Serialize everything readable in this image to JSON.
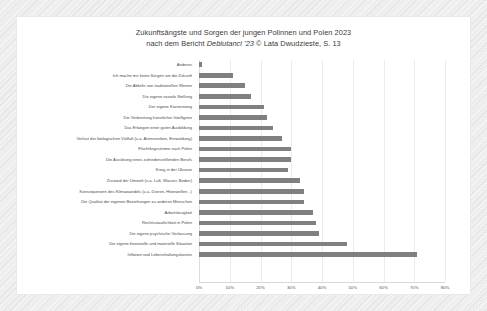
{
  "frame": {
    "border_color": "#ececed",
    "card_bg": "#ffffff"
  },
  "chart_data": {
    "type": "bar",
    "orientation": "horizontal",
    "title": "Zukunftsängste und Sorgen der jungen Polinnen und Polen 2023",
    "subtitle_prefix": "nach dem Bericht ",
    "subtitle_italic": "Debiutanci '23",
    "subtitle_suffix": " © Lata Dwudzieste, S. 13",
    "xlabel": "",
    "ylabel": "",
    "xlim": [
      0,
      80
    ],
    "grid": true,
    "legend": "none",
    "bar_color": "#808080",
    "xtick_labels": [
      "0%",
      "10%",
      "20%",
      "30%",
      "40%",
      "50%",
      "60%",
      "70%",
      "80%"
    ],
    "xtick_values": [
      0,
      10,
      20,
      30,
      40,
      50,
      60,
      70,
      80
    ],
    "categories": [
      "Anderes",
      "Ich mache mir keine Sorgen um die Zukunft",
      "Die Abkehr von traditionellen Werten",
      "Die eigene soziale Stellung",
      "Der eigene Karriereweg",
      "Die Verbreitung künstlicher Intelligenz",
      "Das Erlangen einer guten Ausbildung",
      "Verlust der biologischen Vielfalt (u.a. Artensterben, Entwaldung)",
      "Flüchtlingsströme nach Polen",
      "Die Ausübung eines zufriedenstellenden Berufs",
      "Krieg in der Ukraine",
      "Zustand der Umwelt (u.a. Luft, Wasser, Boden)",
      "Konsequenzen des Klimawandels (u.a. Dürren, Hitzewellen...)",
      "Die Qualität der eigenen Beziehungen zu anderen Menschen",
      "Arbeitslosigkeit",
      "Rechtsstaatlichkeit in Polen",
      "Die eigene psychische Verfassung",
      "Die eigene finanzielle und materielle Situation",
      "Inflation und Lebenshaltungskosten"
    ],
    "values": [
      1,
      11,
      15,
      17,
      21,
      22,
      24,
      27,
      30,
      30,
      29,
      33,
      34,
      34,
      37,
      38,
      39,
      48,
      71
    ]
  }
}
